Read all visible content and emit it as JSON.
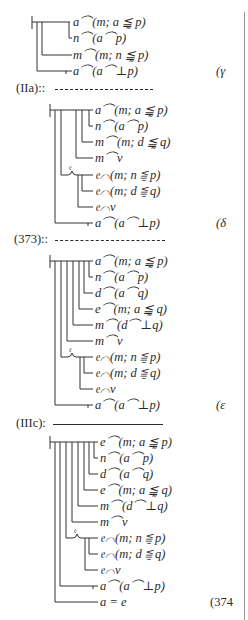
{
  "blocks": [
    {
      "id": "gamma",
      "label": "(γ",
      "judgment_x": 32,
      "top_y": 22,
      "text_x": 73,
      "formulas": [
        {
          "text": "a⌒(m; a ≦̰ p)",
          "y": 22,
          "branch_x": 69,
          "curve": false
        },
        {
          "text": "n⌒(a⌒p)",
          "y": 38,
          "branch_x": 69,
          "curve": false
        },
        {
          "text": "m⌒(m; n ≦̰ p)",
          "y": 55,
          "branch_x": 42,
          "curve": false
        },
        {
          "text": "a⌒(a⌒⊥p)",
          "y": 71,
          "branch_x": 37,
          "curve": false,
          "tick": true
        }
      ],
      "label_y": 71
    },
    {
      "id": "delta",
      "label": "(δ",
      "judgment_x": 50,
      "top_y": 110,
      "text_x": 95,
      "formulas": [
        {
          "text": "a⌒(m; a ≦̰ p)",
          "y": 110
        },
        {
          "text": "n⌒(a⌒p)",
          "y": 126
        },
        {
          "text": "m⌒(m; d ≦̰ q)",
          "y": 142
        },
        {
          "text": "m⌒v",
          "y": 158
        },
        {
          "text": "𝔢⌒(m; n ≦̰ p)",
          "y": 175
        },
        {
          "text": "𝔢⌒(m; d ≦̰ q)",
          "y": 191
        },
        {
          "text": "𝔢⌒v",
          "y": 207
        },
        {
          "text": "a⌒(a⌒⊥p)",
          "y": 223
        }
      ],
      "label_y": 223
    },
    {
      "id": "epsilon",
      "label": "(ε",
      "judgment_x": 50,
      "top_y": 261,
      "text_x": 95,
      "formulas": [
        {
          "text": "a⌒(m; a ≦̰ p)",
          "y": 261
        },
        {
          "text": "n⌒(a⌒p)",
          "y": 277
        },
        {
          "text": "d⌒(a⌒q)",
          "y": 293
        },
        {
          "text": "e⌒(m; a ≦̰ q)",
          "y": 309
        },
        {
          "text": "m⌒(d⌒⊥q)",
          "y": 325
        },
        {
          "text": "m⌒v",
          "y": 341
        },
        {
          "text": "𝔢⌒(m; n ≦̰ p)",
          "y": 357
        },
        {
          "text": "𝔢⌒(m; d ≦̰ q)",
          "y": 373
        },
        {
          "text": "𝔢⌒v",
          "y": 389
        },
        {
          "text": "a⌒(a⌒⊥p)",
          "y": 405
        }
      ],
      "label_y": 405
    },
    {
      "id": "eq374",
      "label": "(374",
      "judgment_x": 50,
      "top_y": 442,
      "text_x": 100,
      "formulas": [
        {
          "text": "e⌒(m; a ≦̰ p)",
          "y": 442
        },
        {
          "text": "n⌒(a⌒p)",
          "y": 458
        },
        {
          "text": "d⌒(a⌒q)",
          "y": 474
        },
        {
          "text": "e⌒(m; a ≦̰ q)",
          "y": 490
        },
        {
          "text": "m⌒(d⌒⊥q)",
          "y": 506
        },
        {
          "text": "m⌒v",
          "y": 522
        },
        {
          "text": "𝔢⌒(m; n ≦̰ p)",
          "y": 538
        },
        {
          "text": "𝔢⌒(m; d ≦̰ q)",
          "y": 554
        },
        {
          "text": "𝔢⌒v",
          "y": 570
        },
        {
          "text": "a⌒(a⌒⊥p)",
          "y": 586
        },
        {
          "text": "a = e",
          "y": 602
        }
      ],
      "label_y": 602
    }
  ],
  "inference_rules": [
    {
      "label": "(IIa)::",
      "y": 88,
      "style": "dashed",
      "x1": 55,
      "x2": 153
    },
    {
      "label": "(373)::",
      "y": 239,
      "style": "dashed",
      "x1": 55,
      "x2": 165
    },
    {
      "label": "(IIIc):",
      "y": 423,
      "style": "solid",
      "x1": 53,
      "x2": 163
    }
  ],
  "quantifier_letter": "𝔢"
}
